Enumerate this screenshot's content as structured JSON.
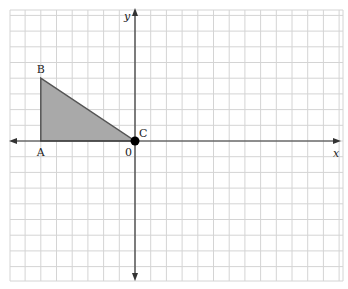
{
  "diagram": {
    "type": "coordinate-grid",
    "grid": {
      "left_px": 10,
      "top_px": 10,
      "right_px": 343,
      "bottom_px": 281,
      "origin_px": [
        135,
        141
      ],
      "unit_px": 15.7,
      "x_range_units": [
        -8,
        13
      ],
      "y_range_units": [
        -9,
        8
      ],
      "line_color": "#d4d4d4"
    },
    "axes": {
      "x_label": "x",
      "y_label": "y",
      "origin_label": "0",
      "color": "#333333"
    },
    "triangle": {
      "fill": "#a9a9a9",
      "stroke": "#555555",
      "vertices": [
        {
          "name": "A",
          "label": "A",
          "coords": [
            -6,
            0
          ]
        },
        {
          "name": "B",
          "label": "B",
          "coords": [
            -6,
            4
          ]
        },
        {
          "name": "C",
          "label": "C",
          "coords": [
            0,
            0
          ]
        }
      ]
    },
    "point_marker": {
      "label": "C",
      "coords": [
        0,
        0
      ],
      "color": "#000000"
    }
  }
}
